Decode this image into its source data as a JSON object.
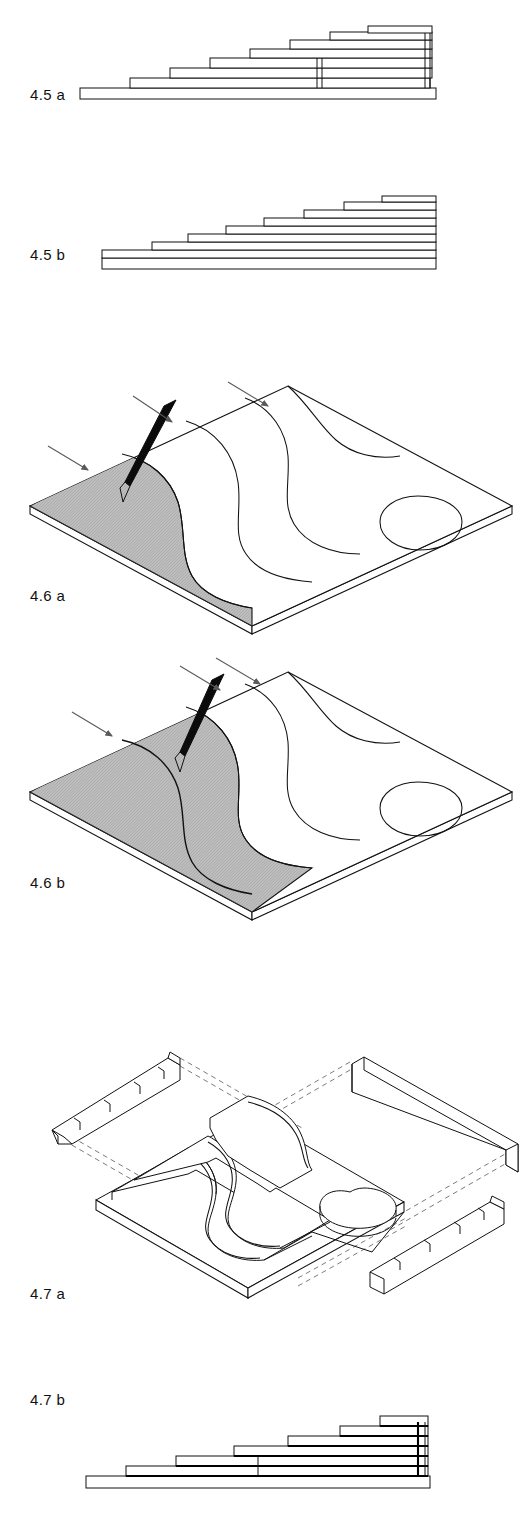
{
  "sheet": {
    "width": 531,
    "height": 1518,
    "background": "#ffffff",
    "line_color": "#111111",
    "shade_color": "#b8b8b8",
    "dashed_color": "#6b6b6b"
  },
  "figures": [
    {
      "id": "fig-4-5-a",
      "label": "4.5 a",
      "caption_x": 30,
      "caption_y": 86,
      "type": "stepped-section-offset",
      "description": "Side elevation of stacked stepped plates, each layer offset, with vertical riser lines at right",
      "step_count": 7,
      "base_plate": true
    },
    {
      "id": "fig-4-5-b",
      "label": "4.5 b",
      "caption_x": 30,
      "caption_y": 246,
      "type": "stepped-section-stacked",
      "description": "Side elevation of right-aligned stacked layers forming a staircase profile",
      "step_count": 8,
      "base_plate": true
    },
    {
      "id": "fig-4-6-a",
      "label": "4.6 a",
      "caption_x": 30,
      "caption_y": 587,
      "type": "isometric-plate-contours",
      "description": "Isometric plate with contour curves, one shaded region cut at the first contour, cutting tool and three direction arrows",
      "shaded_regions": 1,
      "contour_count": 4,
      "arrow_count": 3,
      "tool": "cutting-knife"
    },
    {
      "id": "fig-4-6-b",
      "label": "4.6 b",
      "caption_x": 30,
      "caption_y": 874,
      "type": "isometric-plate-contours",
      "description": "Isometric plate with larger shaded region extending to the second contour, cutting tool and three direction arrows",
      "shaded_regions": 2,
      "contour_count": 4,
      "arrow_count": 3,
      "tool": "cutting-knife"
    },
    {
      "id": "fig-4-7-a",
      "label": "4.7 a",
      "caption_x": 30,
      "caption_y": 1285,
      "type": "isometric-exploded-assembly",
      "description": "Exploded isometric view of terraced contour model with two stepped waste rails and two plain rails displaced, joined by dashed projection lines",
      "terrace_layers": 5,
      "rail_pieces": 4,
      "dashed_projection_lines": true
    },
    {
      "id": "fig-4-7-b",
      "label": "4.7 b",
      "caption_x": 30,
      "caption_y": 1391,
      "type": "stepped-section-heavy",
      "description": "Side elevation of assembled stepped layers with heavy bottom edges and a vertical end wall",
      "step_count": 6,
      "base_plate": true
    }
  ]
}
